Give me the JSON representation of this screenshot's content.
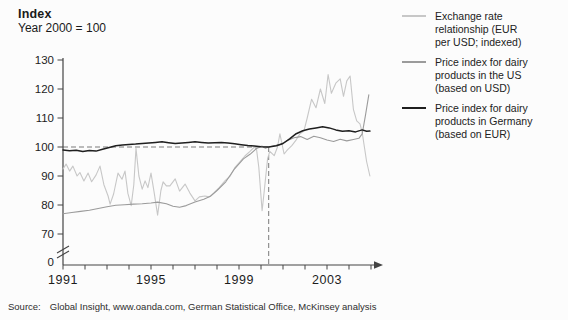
{
  "header": {
    "title": "Index",
    "subtitle": "Year 2000 = 100"
  },
  "source": {
    "label": "Source:",
    "text": "Global Insight, www.oanda.com, German Statistical Office, McKinsey analysis"
  },
  "legend": {
    "items": [
      {
        "name": "exchange-rate",
        "color": "#c7c7c7",
        "lines": [
          "Exchange rate",
          "relationship (EUR",
          "per USD; indexed)"
        ]
      },
      {
        "name": "us-dairy",
        "color": "#9b9b9b",
        "lines": [
          "Price index for dairy",
          "products in the US",
          "(based on USD)"
        ]
      },
      {
        "name": "germany-dairy",
        "color": "#1f1f1f",
        "lines": [
          "Price index for dairy",
          "products in Germany",
          "(based on EUR)"
        ]
      }
    ]
  },
  "chart_data": {
    "type": "line",
    "title": "Index",
    "subtitle": "Year 2000 = 100",
    "xlabel": "",
    "ylabel": "Index (Year 2000 = 100)",
    "xlim": [
      1991,
      2005
    ],
    "ylim": [
      70,
      130
    ],
    "y_axis_break_to_zero": true,
    "grid": false,
    "legend_position": "right",
    "y_ticks": [
      130,
      120,
      110,
      100,
      90,
      80,
      70
    ],
    "y_origin_label": "0",
    "x_tick_years": [
      1991,
      1992,
      1993,
      1994,
      1995,
      1996,
      1997,
      1998,
      1999,
      2000,
      2001,
      2002,
      2003,
      2004,
      2005
    ],
    "x_tick_labels": [
      {
        "year": 1991,
        "label": "1991"
      },
      {
        "year": 1995,
        "label": "1995"
      },
      {
        "year": 1999,
        "label": "1999"
      },
      {
        "year": 2003,
        "label": "2003"
      }
    ],
    "annotations": {
      "dashed_horizontal_at_value": 100,
      "dashed_vertical_at_year": 2000.35,
      "note": "dashed lines mark where indexes equal 100 around year 2000"
    },
    "axis_color": "#444444",
    "dash_color": "#7a7a7a",
    "series": [
      {
        "name": "Exchange rate relationship (EUR per USD; indexed)",
        "color": "#c7c7c7",
        "width": 1.1,
        "points": [
          [
            1991.0,
            92.4
          ],
          [
            1991.14,
            94.1
          ],
          [
            1991.3,
            91.7
          ],
          [
            1991.45,
            93.4
          ],
          [
            1991.64,
            90.0
          ],
          [
            1991.77,
            91.2
          ],
          [
            1991.95,
            88.3
          ],
          [
            1992.14,
            91.0
          ],
          [
            1992.3,
            88.0
          ],
          [
            1992.5,
            90.3
          ],
          [
            1992.68,
            93.4
          ],
          [
            1992.86,
            87.0
          ],
          [
            1993.05,
            83.1
          ],
          [
            1993.14,
            80.3
          ],
          [
            1993.3,
            83.8
          ],
          [
            1993.5,
            91.0
          ],
          [
            1993.68,
            88.9
          ],
          [
            1993.82,
            91.7
          ],
          [
            1993.95,
            84.0
          ],
          [
            1994.1,
            79.8
          ],
          [
            1994.22,
            87.0
          ],
          [
            1994.32,
            99.5
          ],
          [
            1994.45,
            90.0
          ],
          [
            1994.6,
            85.5
          ],
          [
            1994.73,
            88.3
          ],
          [
            1994.86,
            86.0
          ],
          [
            1995.0,
            91.0
          ],
          [
            1995.15,
            84.0
          ],
          [
            1995.3,
            76.5
          ],
          [
            1995.45,
            85.0
          ],
          [
            1995.55,
            88.0
          ],
          [
            1995.7,
            86.6
          ],
          [
            1995.86,
            86.6
          ],
          [
            1996.1,
            89.0
          ],
          [
            1996.3,
            84.8
          ],
          [
            1996.55,
            87.2
          ],
          [
            1996.77,
            84.1
          ],
          [
            1997.0,
            81.4
          ],
          [
            1997.2,
            82.8
          ],
          [
            1997.45,
            83.1
          ],
          [
            1997.64,
            82.8
          ],
          [
            1997.86,
            84.2
          ],
          [
            1998.1,
            86.0
          ],
          [
            1998.36,
            88.3
          ],
          [
            1998.6,
            90.0
          ],
          [
            1998.8,
            92.8
          ],
          [
            1999.05,
            95.0
          ],
          [
            1999.27,
            96.9
          ],
          [
            1999.5,
            98.5
          ],
          [
            1999.7,
            100.0
          ],
          [
            1999.8,
            99.0
          ],
          [
            1999.9,
            93.0
          ],
          [
            2000.05,
            78.0
          ],
          [
            2000.15,
            85.0
          ],
          [
            2000.3,
            96.0
          ],
          [
            2000.4,
            98.5
          ],
          [
            2000.6,
            97.0
          ],
          [
            2000.75,
            100.0
          ],
          [
            2000.86,
            104.5
          ],
          [
            2001.05,
            97.6
          ],
          [
            2001.2,
            99.0
          ],
          [
            2001.4,
            100.5
          ],
          [
            2001.6,
            102.5
          ],
          [
            2001.77,
            104.5
          ],
          [
            2001.95,
            105.5
          ],
          [
            2002.1,
            110.0
          ],
          [
            2002.3,
            116.5
          ],
          [
            2002.5,
            113.5
          ],
          [
            2002.7,
            120.0
          ],
          [
            2002.9,
            115.0
          ],
          [
            2003.05,
            125.0
          ],
          [
            2003.2,
            118.5
          ],
          [
            2003.4,
            122.0
          ],
          [
            2003.6,
            123.5
          ],
          [
            2003.75,
            117.5
          ],
          [
            2003.9,
            122.8
          ],
          [
            2004.05,
            124.5
          ],
          [
            2004.2,
            113.0
          ],
          [
            2004.35,
            109.0
          ],
          [
            2004.5,
            108.0
          ],
          [
            2004.6,
            105.0
          ],
          [
            2004.7,
            100.0
          ],
          [
            2004.8,
            95.0
          ],
          [
            2004.95,
            90.0
          ]
        ]
      },
      {
        "name": "Price index for dairy products in the US (based on USD)",
        "color": "#9b9b9b",
        "width": 1.1,
        "points": [
          [
            1991.0,
            77.0
          ],
          [
            1991.4,
            77.4
          ],
          [
            1991.8,
            77.8
          ],
          [
            1992.2,
            78.2
          ],
          [
            1992.6,
            78.8
          ],
          [
            1993.0,
            79.4
          ],
          [
            1993.4,
            79.9
          ],
          [
            1993.8,
            80.1
          ],
          [
            1994.2,
            80.3
          ],
          [
            1994.6,
            80.4
          ],
          [
            1995.0,
            80.7
          ],
          [
            1995.3,
            81.0
          ],
          [
            1995.7,
            80.4
          ],
          [
            1996.0,
            79.6
          ],
          [
            1996.3,
            79.2
          ],
          [
            1996.6,
            79.8
          ],
          [
            1997.0,
            81.0
          ],
          [
            1997.4,
            82.0
          ],
          [
            1997.7,
            83.0
          ],
          [
            1998.0,
            85.0
          ],
          [
            1998.4,
            88.0
          ],
          [
            1998.8,
            92.5
          ],
          [
            1999.2,
            95.9
          ],
          [
            1999.5,
            97.5
          ],
          [
            1999.8,
            99.5
          ],
          [
            2000.05,
            100.3
          ],
          [
            2000.2,
            99.6
          ],
          [
            2000.35,
            100.0
          ],
          [
            2000.6,
            100.4
          ],
          [
            2000.9,
            100.9
          ],
          [
            2001.2,
            102.2
          ],
          [
            2001.5,
            103.2
          ],
          [
            2001.8,
            103.6
          ],
          [
            2002.1,
            102.6
          ],
          [
            2002.4,
            103.7
          ],
          [
            2002.7,
            103.2
          ],
          [
            2003.0,
            102.4
          ],
          [
            2003.3,
            101.9
          ],
          [
            2003.6,
            102.7
          ],
          [
            2003.9,
            102.1
          ],
          [
            2004.2,
            102.6
          ],
          [
            2004.45,
            103.0
          ],
          [
            2004.6,
            104.5
          ],
          [
            2004.75,
            111.0
          ],
          [
            2004.9,
            118.0
          ]
        ]
      },
      {
        "name": "Price index for dairy products in Germany (based on EUR)",
        "color": "#1f1f1f",
        "width": 1.5,
        "points": [
          [
            1991.0,
            99.0
          ],
          [
            1991.3,
            98.7
          ],
          [
            1991.6,
            98.9
          ],
          [
            1991.9,
            98.4
          ],
          [
            1992.2,
            98.8
          ],
          [
            1992.5,
            98.6
          ],
          [
            1992.8,
            99.2
          ],
          [
            1993.1,
            99.8
          ],
          [
            1993.4,
            100.4
          ],
          [
            1993.7,
            100.7
          ],
          [
            1994.0,
            100.9
          ],
          [
            1994.3,
            101.0
          ],
          [
            1994.6,
            101.2
          ],
          [
            1994.9,
            101.4
          ],
          [
            1995.2,
            101.6
          ],
          [
            1995.5,
            101.8
          ],
          [
            1995.8,
            101.5
          ],
          [
            1996.1,
            101.2
          ],
          [
            1996.4,
            101.4
          ],
          [
            1996.7,
            101.6
          ],
          [
            1997.0,
            101.8
          ],
          [
            1997.3,
            101.6
          ],
          [
            1997.6,
            101.4
          ],
          [
            1997.9,
            101.5
          ],
          [
            1998.2,
            101.6
          ],
          [
            1998.5,
            101.4
          ],
          [
            1998.8,
            101.1
          ],
          [
            1999.1,
            100.8
          ],
          [
            1999.4,
            100.5
          ],
          [
            1999.7,
            100.3
          ],
          [
            2000.0,
            100.1
          ],
          [
            2000.35,
            100.0
          ],
          [
            2000.7,
            100.4
          ],
          [
            2001.0,
            101.2
          ],
          [
            2001.3,
            102.8
          ],
          [
            2001.6,
            104.6
          ],
          [
            2001.9,
            105.6
          ],
          [
            2002.2,
            106.2
          ],
          [
            2002.5,
            106.6
          ],
          [
            2002.8,
            107.0
          ],
          [
            2003.1,
            106.6
          ],
          [
            2003.4,
            105.9
          ],
          [
            2003.7,
            105.4
          ],
          [
            2004.0,
            105.6
          ],
          [
            2004.3,
            105.2
          ],
          [
            2004.6,
            105.9
          ],
          [
            2004.8,
            105.4
          ],
          [
            2004.95,
            105.5
          ]
        ]
      }
    ]
  }
}
